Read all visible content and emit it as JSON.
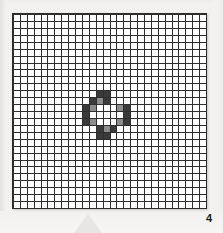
{
  "figure": {
    "number_label": "4",
    "caption_position": "bottom-right"
  },
  "grid": {
    "columns": 28,
    "rows": 28,
    "cell_size_px": 6.9,
    "line_color": "#2e2e2e",
    "cell_fill_color": "#ffffff",
    "border_color": "#2b2b2b",
    "page_background": "#f2f1f0"
  },
  "pattern": {
    "description": "diamond-shaped ring of shaded cells near the centre of the grid",
    "dark_color": "#3a3a3a",
    "mid_color": "#8c8c8c",
    "origin_col": 10,
    "origin_row": 11,
    "rows": [
      "..DD...",
      ".DMD...",
      "DM...MD",
      "D.....D",
      "DM...MD",
      "..DMD..",
      "..DD..."
    ],
    "legend": {
      "D": "dark filled cell",
      "M": "mid-gray filled cell",
      ".": "empty white cell"
    }
  },
  "decoration": {
    "bottom_triangle_color": "#e6e5e4",
    "bottom_triangle_name": "up-triangle-watermark"
  }
}
